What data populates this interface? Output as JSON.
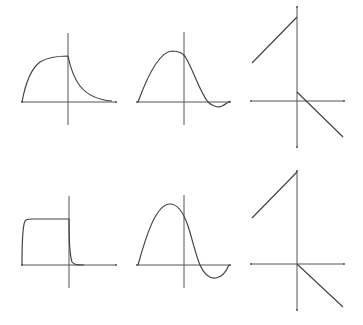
{
  "diagram": {
    "colors": {
      "background": "#ffffff",
      "axis": "#555555",
      "curve": "#444444"
    },
    "panels": [
      {
        "id": "top-left",
        "shape": "rise to plateau for x<0, exponential decay for x>0"
      },
      {
        "id": "top-middle",
        "shape": "smooth hump peaking left of origin, crossing axis and small dip on right"
      },
      {
        "id": "top-right",
        "shape": "piecewise linear: rising line ending at top of y-axis for x<0, falling line starting below for x>0"
      },
      {
        "id": "bottom-left",
        "shape": "near rectangular pulse for x<0, sharp drop at origin"
      },
      {
        "id": "bottom-middle",
        "shape": "one sine-like period: large hump then trough"
      },
      {
        "id": "bottom-right",
        "shape": "piecewise linear: rising line to top of y-axis for x<0, falling line from origin for x>0"
      }
    ]
  }
}
